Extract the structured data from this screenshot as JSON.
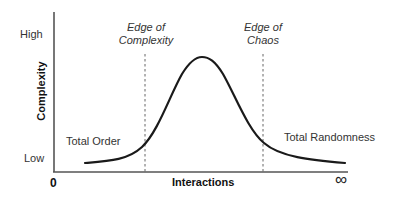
{
  "diagram": {
    "y_axis": {
      "label": "Complexity",
      "ticks": {
        "high": "High",
        "low": "Low"
      }
    },
    "x_axis": {
      "label": "Interactions",
      "start": "0",
      "end": "∞"
    },
    "markers": [
      {
        "line1": "Edge of",
        "line2": "Complexity"
      },
      {
        "line1": "Edge of",
        "line2": "Chaos"
      }
    ],
    "regions": {
      "left": "Total Order",
      "right": "Total Randomness"
    },
    "colors": {
      "curve": "#1a1a1a",
      "axis": "#555555",
      "dashed": "#666666",
      "text": "#333333"
    }
  }
}
